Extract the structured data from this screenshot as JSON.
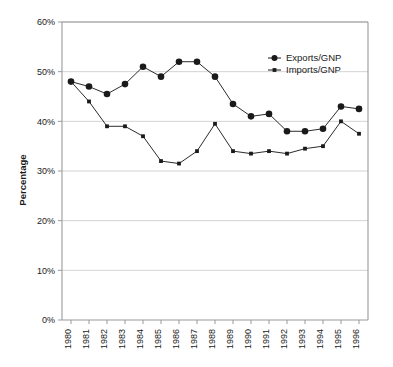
{
  "chart_data": {
    "type": "line",
    "title": "",
    "xlabel": "",
    "ylabel": "Percentage",
    "ylim": [
      0,
      60
    ],
    "ytick_labels": [
      "0%",
      "10%",
      "20%",
      "30%",
      "40%",
      "50%",
      "60%"
    ],
    "ytick_values": [
      0,
      10,
      20,
      30,
      40,
      50,
      60
    ],
    "grid": true,
    "legend_position": "top-right",
    "categories": [
      "1980",
      "1981",
      "1982",
      "1983",
      "1984",
      "1985",
      "1986",
      "1987",
      "1988",
      "1989",
      "1990",
      "1991",
      "1992",
      "1993",
      "1994",
      "1995",
      "1996"
    ],
    "series": [
      {
        "name": "Exports/GNP",
        "marker": "circle",
        "color": "#1a1a1a",
        "values": [
          48.0,
          47.0,
          45.5,
          47.5,
          51.0,
          49.0,
          52.0,
          52.0,
          49.0,
          43.5,
          41.0,
          41.5,
          38.0,
          38.0,
          38.5,
          43.0,
          42.5
        ]
      },
      {
        "name": "Imports/GNP",
        "marker": "square",
        "color": "#1a1a1a",
        "values": [
          48.0,
          44.0,
          39.0,
          39.0,
          37.0,
          32.0,
          31.5,
          34.0,
          39.5,
          34.0,
          33.5,
          34.0,
          33.5,
          34.5,
          35.0,
          40.0,
          37.5
        ]
      }
    ]
  },
  "legend": {
    "entries": [
      {
        "label": "Exports/GNP"
      },
      {
        "label": "Imports/GNP"
      }
    ]
  }
}
